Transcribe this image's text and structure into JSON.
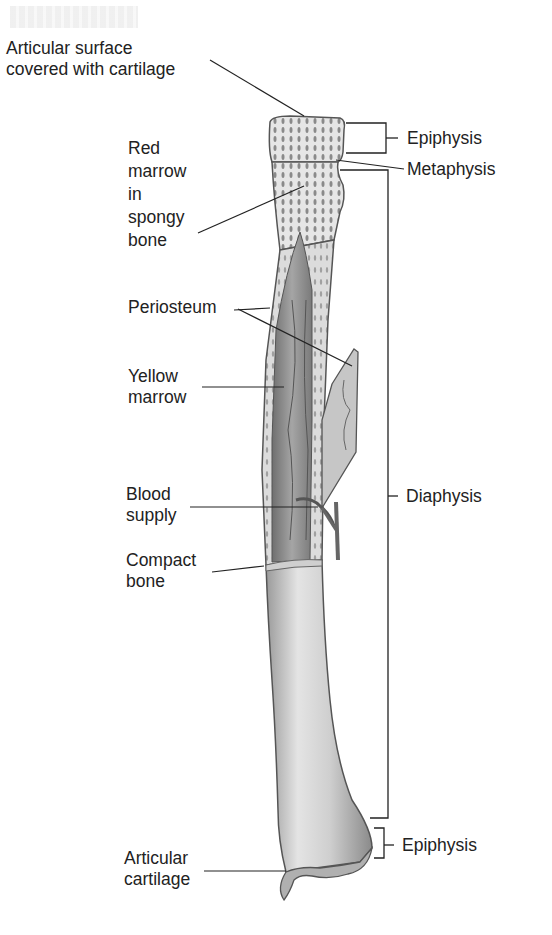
{
  "labels_left": [
    {
      "id": "articular-surface",
      "lines": [
        "Articular surface",
        "covered with cartilage"
      ]
    },
    {
      "id": "red-marrow",
      "lines": [
        "Red",
        "marrow",
        "in",
        "spongy",
        "bone"
      ]
    },
    {
      "id": "periosteum",
      "lines": [
        "Periosteum"
      ]
    },
    {
      "id": "yellow-marrow",
      "lines": [
        "Yellow",
        "marrow"
      ]
    },
    {
      "id": "blood-supply",
      "lines": [
        "Blood",
        "supply"
      ]
    },
    {
      "id": "compact-bone",
      "lines": [
        "Compact",
        "bone"
      ]
    },
    {
      "id": "articular-cartilage",
      "lines": [
        "Articular",
        "cartilage"
      ]
    }
  ],
  "labels_right": [
    {
      "id": "epiphysis-proximal",
      "text": "Epiphysis"
    },
    {
      "id": "metaphysis",
      "text": "Metaphysis"
    },
    {
      "id": "diaphysis",
      "text": "Diaphysis"
    },
    {
      "id": "epiphysis-distal",
      "text": "Epiphysis"
    }
  ],
  "colors": {
    "bone_light": "#d8d8d8",
    "bone_mid": "#b8b8b8",
    "marrow": "#8f8f8f",
    "outline": "#555555",
    "leader": "#222222"
  }
}
